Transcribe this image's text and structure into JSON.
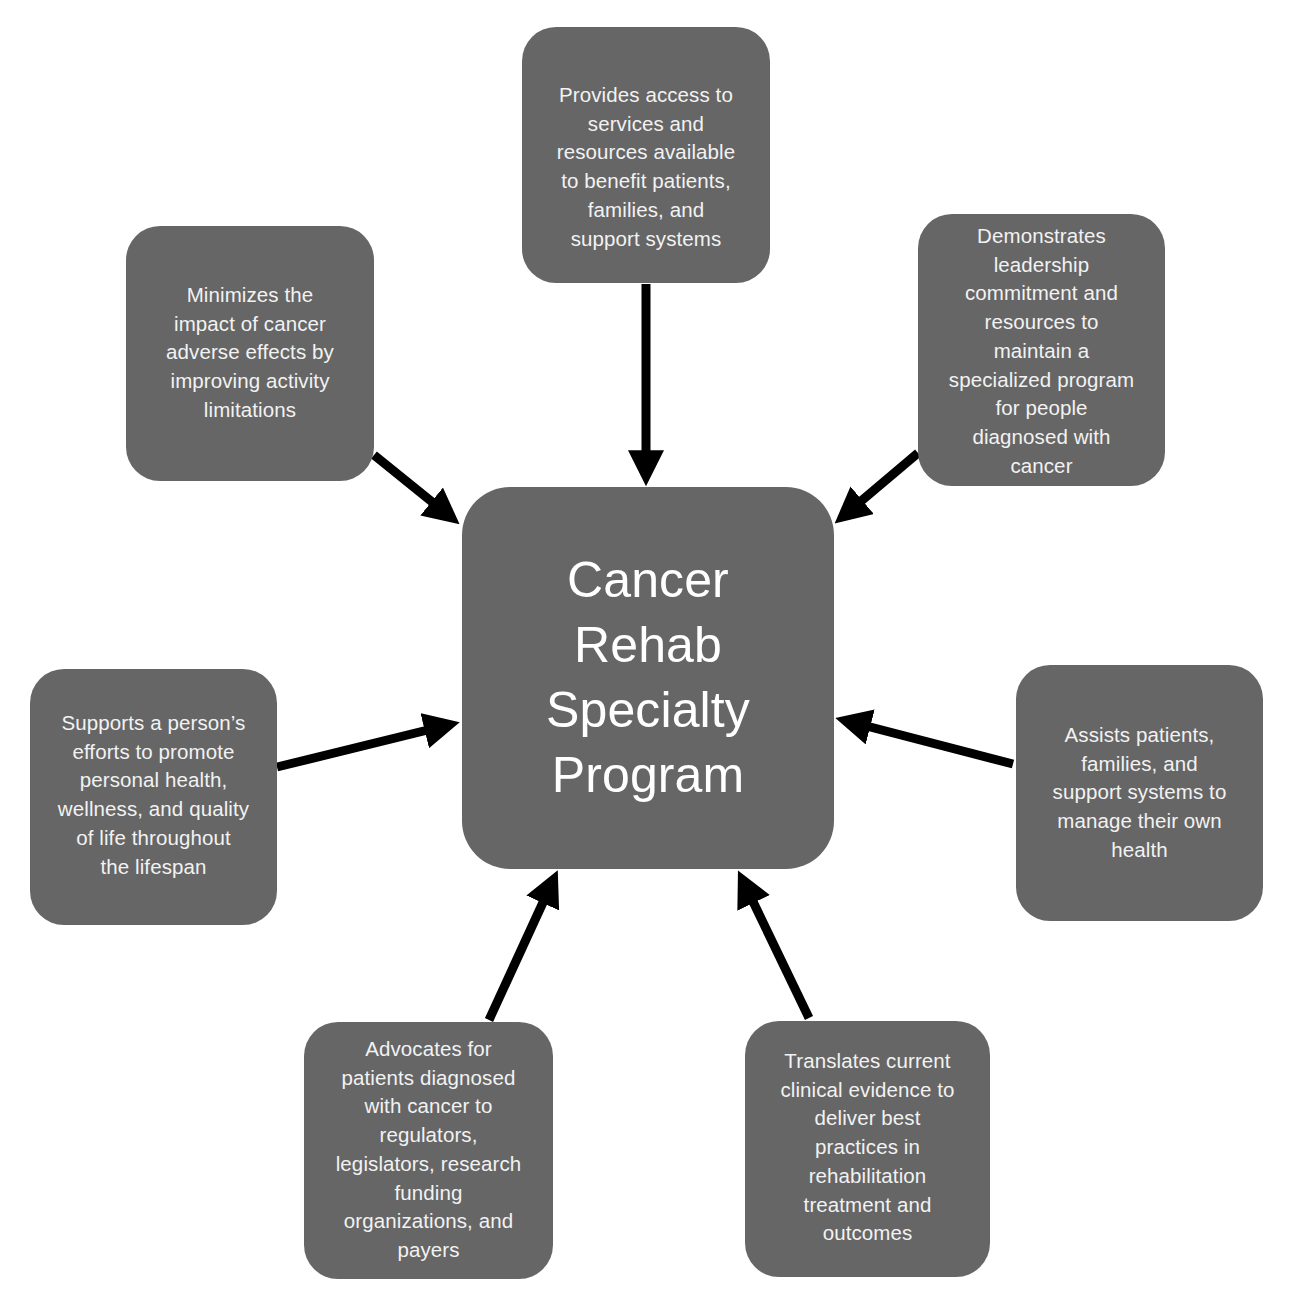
{
  "diagram": {
    "center": {
      "label": "Cancer Rehab Specialty Program",
      "lines": [
        "Cancer",
        "Rehab",
        "Specialty",
        "Program"
      ]
    },
    "nodes": [
      {
        "id": "top",
        "lines": [
          "Provides access to",
          "services and",
          "resources available",
          "to benefit patients,",
          "families, and",
          "support systems"
        ]
      },
      {
        "id": "top-right",
        "lines": [
          "Demonstrates",
          "leadership",
          "commitment and",
          "resources to",
          "maintain a",
          "specialized program",
          "for people",
          "diagnosed with",
          "cancer"
        ]
      },
      {
        "id": "right",
        "lines": [
          "Assists patients,",
          "families, and",
          "support systems to",
          "manage their own",
          "health"
        ]
      },
      {
        "id": "bottom-right",
        "lines": [
          "Translates current",
          "clinical evidence to",
          "deliver best",
          "practices in",
          "rehabilitation",
          "treatment and",
          "outcomes"
        ]
      },
      {
        "id": "bottom-left",
        "lines": [
          "Advocates for",
          "patients diagnosed",
          "with cancer to",
          "regulators,",
          "legislators, research",
          "funding",
          "organizations, and",
          "payers"
        ]
      },
      {
        "id": "left",
        "lines": [
          "Supports a person’s",
          "efforts to promote",
          "personal health,",
          "wellness, and quality",
          "of life throughout",
          "the lifespan"
        ]
      },
      {
        "id": "top-left",
        "lines": [
          "Minimizes the",
          "impact of cancer",
          "adverse effects by",
          "improving activity",
          "limitations"
        ]
      }
    ],
    "edges": [
      {
        "from": "top",
        "to": "center"
      },
      {
        "from": "top-right",
        "to": "center"
      },
      {
        "from": "right",
        "to": "center"
      },
      {
        "from": "bottom-right",
        "to": "center"
      },
      {
        "from": "bottom-left",
        "to": "center"
      },
      {
        "from": "left",
        "to": "center"
      },
      {
        "from": "top-left",
        "to": "center"
      }
    ],
    "colors": {
      "box_fill": "#666666",
      "text": "#f2f2f2",
      "arrow": "#000000",
      "background": "#ffffff"
    }
  }
}
